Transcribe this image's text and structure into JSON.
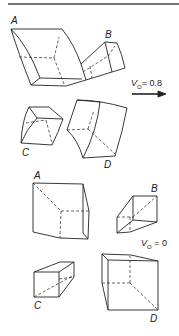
{
  "figure": {
    "top_panel": {
      "velocity_label": {
        "symbol": "V",
        "subscript": "O",
        "equals": "=",
        "value": "0.8"
      },
      "arrow": "right-arrow",
      "cubes": [
        {
          "label": "A"
        },
        {
          "label": "B"
        },
        {
          "label": "C"
        },
        {
          "label": "D"
        }
      ]
    },
    "bottom_panel": {
      "velocity_label": {
        "symbol": "V",
        "subscript": "O",
        "equals": "=",
        "value": "0"
      },
      "cubes": [
        {
          "label": "A"
        },
        {
          "label": "B"
        },
        {
          "label": "C"
        },
        {
          "label": "D"
        }
      ]
    }
  }
}
